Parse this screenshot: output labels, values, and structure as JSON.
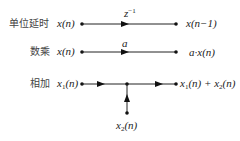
{
  "diagram": {
    "title": "",
    "rows": [
      {
        "label": "单位延时",
        "input": "x(n)",
        "branch_label": "z",
        "branch_label_sup": "−1",
        "output": "x(n−1)"
      },
      {
        "label": "数乘",
        "input": "x(n)",
        "branch_label": "a",
        "output": "a·x(n)"
      },
      {
        "label": "相加",
        "input_main": "x",
        "input_sub": "1",
        "input_tail": "(n)",
        "input2_main": "x",
        "input2_sub": "2",
        "input2_tail": "(n)",
        "output_a_main": "x",
        "output_a_sub": "1",
        "output_a_tail": "(n) + ",
        "output_b_main": "x",
        "output_b_sub": "2",
        "output_b_tail": "(n)"
      }
    ],
    "colors": {
      "line": "#222222",
      "text": "#222222",
      "label": "#444444"
    }
  }
}
